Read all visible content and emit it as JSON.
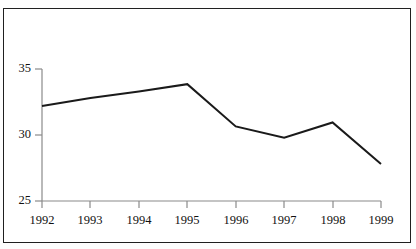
{
  "figure": {
    "title": "",
    "background_color": "#ffffff",
    "border_color": "#1f1f1f"
  },
  "axis": {
    "y_ticks": [
      "35",
      "30",
      "25"
    ],
    "x_ticks": [
      "1992",
      "1993",
      "1994",
      "1995",
      "1996",
      "1997",
      "1998",
      "1999"
    ],
    "line_color": "#7a7a7a",
    "series_color": "#1a1a1a"
  },
  "chart_data": {
    "type": "line",
    "title": "",
    "xlabel": "",
    "ylabel": "",
    "categories": [
      "1992",
      "1993",
      "1994",
      "1995",
      "1996",
      "1997",
      "1998",
      "1999"
    ],
    "x": [
      1992,
      1993,
      1994,
      1995,
      1996,
      1997,
      1998,
      1999
    ],
    "values": [
      32.2,
      32.8,
      33.3,
      33.85,
      30.65,
      29.8,
      30.95,
      27.8
    ],
    "series": [
      {
        "name": "series-1",
        "values": [
          32.2,
          32.8,
          33.3,
          33.85,
          30.65,
          29.8,
          30.95,
          27.8
        ],
        "color": "#1a1a1a",
        "line_width": 2.0,
        "markers": false
      }
    ],
    "ylim": [
      25,
      35.8
    ],
    "xlim": [
      1992,
      1999
    ],
    "y_tick_values": [
      35,
      30,
      25
    ],
    "grid": false,
    "legend": false,
    "legend_position": "none"
  }
}
